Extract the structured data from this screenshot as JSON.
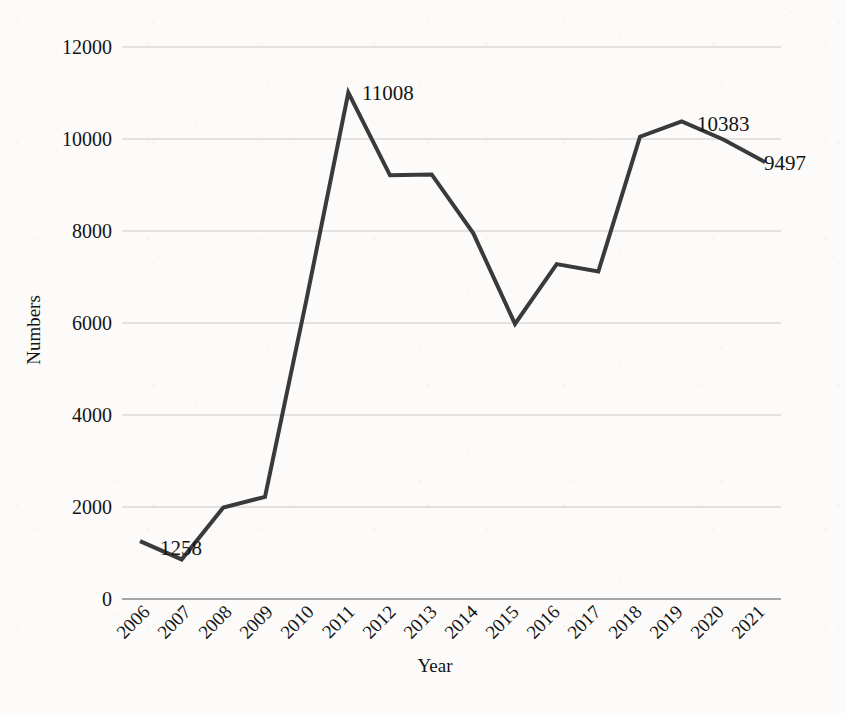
{
  "chart_data": {
    "type": "line",
    "title": "",
    "xlabel": "Year",
    "ylabel": "Numbers",
    "grid": true,
    "legend": false,
    "categories": [
      "2006",
      "2007",
      "2008",
      "2009",
      "2010",
      "2011",
      "2012",
      "2013",
      "2014",
      "2015",
      "2016",
      "2017",
      "2018",
      "2019",
      "2020",
      "2021"
    ],
    "values": [
      1258,
      860,
      1990,
      2220,
      6530,
      11008,
      9210,
      9230,
      7950,
      5980,
      7280,
      7120,
      10050,
      10383,
      9990,
      9497
    ],
    "ylim": [
      0,
      12000
    ],
    "yticks": [
      0,
      2000,
      4000,
      6000,
      8000,
      10000,
      12000
    ],
    "ytick_labels": [
      "0",
      "2000",
      "4000",
      "6000",
      "8000",
      "10000",
      "12000"
    ],
    "xtick_rotation": -45,
    "series_color": "#3a3a3a",
    "grid_color": "#c9c9c9",
    "background_color": "#fcfbf9",
    "annotations": [
      {
        "category": "2006",
        "value": 1258,
        "text": "1258"
      },
      {
        "category": "2011",
        "value": 11008,
        "text": "11008"
      },
      {
        "category": "2019",
        "value": 10383,
        "text": "10383"
      },
      {
        "category": "2021",
        "value": 9497,
        "text": "9497"
      }
    ]
  }
}
